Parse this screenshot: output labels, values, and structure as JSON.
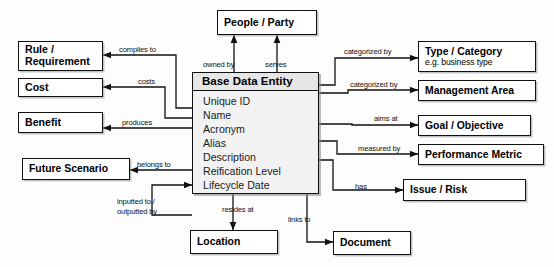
{
  "diagram": {
    "title": "Base Data Entity",
    "central_entity": {
      "name": "Base Data Entity",
      "attributes": [
        "Unique ID",
        "Name",
        "Acronym",
        "Alias",
        "Description",
        "Reification Level",
        "Lifecycle Date"
      ]
    },
    "nodes": [
      {
        "id": "people-party",
        "label": "People / Party",
        "sub": ""
      },
      {
        "id": "rule-requirement",
        "label": "Rule /\nRequirement",
        "line1": "Rule /",
        "line2": "Requirement",
        "sub": ""
      },
      {
        "id": "cost",
        "label": "Cost",
        "sub": ""
      },
      {
        "id": "benefit",
        "label": "Benefit",
        "sub": ""
      },
      {
        "id": "future-scenario",
        "label": "Future Scenario",
        "sub": ""
      },
      {
        "id": "type-category",
        "label": "Type / Category",
        "sub": "e.g. business type"
      },
      {
        "id": "management-area",
        "label": "Management Area",
        "sub": ""
      },
      {
        "id": "goal-objective",
        "label": "Goal / Objective",
        "sub": ""
      },
      {
        "id": "performance-metric",
        "label": "Performance Metric",
        "sub": ""
      },
      {
        "id": "issue-risk",
        "label": "Issue / Risk",
        "sub": ""
      },
      {
        "id": "location",
        "label": "Location",
        "sub": ""
      },
      {
        "id": "document",
        "label": "Document",
        "sub": ""
      }
    ],
    "edges": [
      {
        "id": "owned-by",
        "label": "owned by",
        "from": "base-data-entity",
        "to": "people-party"
      },
      {
        "id": "serves",
        "label": "serves",
        "from": "base-data-entity",
        "to": "people-party"
      },
      {
        "id": "complies-to",
        "label": "complies to",
        "from": "base-data-entity",
        "to": "rule-requirement"
      },
      {
        "id": "costs",
        "label": "costs",
        "from": "base-data-entity",
        "to": "cost"
      },
      {
        "id": "produces",
        "label": "produces",
        "from": "base-data-entity",
        "to": "benefit"
      },
      {
        "id": "belongs-to",
        "label": "belongs to",
        "from": "base-data-entity",
        "to": "future-scenario"
      },
      {
        "id": "inputted-outputted",
        "label": "inputted to /",
        "label2": "outputted by",
        "from": "base-data-entity",
        "to": "base-data-entity"
      },
      {
        "id": "categorized-by-1",
        "label": "categorized by",
        "from": "base-data-entity",
        "to": "type-category"
      },
      {
        "id": "categorized-by-2",
        "label": "categorized by",
        "from": "base-data-entity",
        "to": "management-area"
      },
      {
        "id": "aims-at",
        "label": "aims at",
        "from": "base-data-entity",
        "to": "goal-objective"
      },
      {
        "id": "measured-by",
        "label": "measured by",
        "from": "base-data-entity",
        "to": "performance-metric"
      },
      {
        "id": "has",
        "label": "has",
        "from": "base-data-entity",
        "to": "issue-risk"
      },
      {
        "id": "resides-at",
        "label": "resides at",
        "from": "base-data-entity",
        "to": "location"
      },
      {
        "id": "links-to",
        "label": "links to",
        "from": "base-data-entity",
        "to": "document"
      }
    ],
    "colors": {
      "background": "#fdfdfd",
      "stroke": "#111111",
      "entity_header_fill": "#e6e6e6",
      "entity_body_fill": "#f2f2f2",
      "node_fill": "#ffffff"
    }
  }
}
